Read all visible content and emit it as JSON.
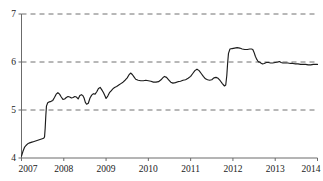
{
  "chart_data": {
    "type": "line",
    "title": "",
    "subtitle": "",
    "xlabel": "",
    "ylabel": "",
    "xlim": [
      2007.0,
      2014.0
    ],
    "ylim": [
      4,
      7
    ],
    "grid": true,
    "grid_axis": "y",
    "legend": false,
    "legend_position": "none",
    "line_color": "#1c1c1c",
    "grid_color": "#4d4d4d",
    "axis_color": "#6b6b6b",
    "background_color": "#ffffff",
    "y_ticks": [
      4,
      5,
      6,
      7
    ],
    "y_tick_labels": [
      "4",
      "5",
      "6",
      "7"
    ],
    "x_ticks": [
      2007,
      2008,
      2009,
      2010,
      2011,
      2012,
      2013,
      2014
    ],
    "x_tick_labels": [
      "2007",
      "2008",
      "2009",
      "2010",
      "2011",
      "2012",
      "2013",
      "2014"
    ],
    "series": [
      {
        "name": "series-1",
        "x": [
          2007.0,
          2007.035,
          2007.07,
          2007.105,
          2007.14,
          2007.175,
          2007.21,
          2007.245,
          2007.28,
          2007.315,
          2007.35,
          2007.385,
          2007.42,
          2007.455,
          2007.49,
          2007.525,
          2007.545,
          2007.56,
          2007.575,
          2007.59,
          2007.62,
          2007.66,
          2007.7,
          2007.74,
          2007.78,
          2007.82,
          2007.86,
          2007.9,
          2007.94,
          2007.98,
          2008.02,
          2008.06,
          2008.1,
          2008.14,
          2008.18,
          2008.22,
          2008.26,
          2008.3,
          2008.34,
          2008.38,
          2008.42,
          2008.45,
          2008.48,
          2008.51,
          2008.54,
          2008.58,
          2008.62,
          2008.66,
          2008.7,
          2008.74,
          2008.78,
          2008.82,
          2008.86,
          2008.9,
          2008.94,
          2008.97,
          2009.0,
          2009.04,
          2009.08,
          2009.12,
          2009.16,
          2009.2,
          2009.25,
          2009.3,
          2009.35,
          2009.4,
          2009.45,
          2009.5,
          2009.54,
          2009.58,
          2009.62,
          2009.66,
          2009.7,
          2009.76,
          2009.82,
          2009.88,
          2009.94,
          2010.0,
          2010.06,
          2010.12,
          2010.18,
          2010.24,
          2010.3,
          2010.34,
          2010.38,
          2010.43,
          2010.48,
          2010.53,
          2010.58,
          2010.64,
          2010.7,
          2010.76,
          2010.82,
          2010.88,
          2010.94,
          2011.0,
          2011.05,
          2011.1,
          2011.15,
          2011.2,
          2011.25,
          2011.3,
          2011.35,
          2011.4,
          2011.45,
          2011.5,
          2011.55,
          2011.6,
          2011.65,
          2011.7,
          2011.75,
          2011.8,
          2011.83,
          2011.855,
          2011.875,
          2011.895,
          2011.93,
          2011.98,
          2012.04,
          2012.1,
          2012.16,
          2012.22,
          2012.28,
          2012.34,
          2012.4,
          2012.44,
          2012.47,
          2012.5,
          2012.53,
          2012.56,
          2012.59,
          2012.61,
          2012.63,
          2012.66,
          2012.7,
          2012.74,
          2012.79,
          2012.84,
          2012.89,
          2012.94,
          2013.0,
          2013.06,
          2013.1,
          2013.14,
          2013.18,
          2013.24,
          2013.3,
          2013.36,
          2013.42,
          2013.48,
          2013.54,
          2013.6,
          2013.66,
          2013.72,
          2013.78,
          2013.84,
          2013.9,
          2013.95,
          2014.0
        ],
        "y": [
          4.04,
          4.14,
          4.22,
          4.26,
          4.29,
          4.31,
          4.32,
          4.33,
          4.34,
          4.35,
          4.36,
          4.37,
          4.38,
          4.39,
          4.4,
          4.41,
          4.44,
          4.62,
          4.88,
          5.08,
          5.15,
          5.17,
          5.18,
          5.2,
          5.26,
          5.33,
          5.36,
          5.33,
          5.27,
          5.22,
          5.23,
          5.26,
          5.28,
          5.27,
          5.25,
          5.26,
          5.28,
          5.27,
          5.23,
          5.3,
          5.32,
          5.3,
          5.25,
          5.16,
          5.12,
          5.14,
          5.25,
          5.31,
          5.34,
          5.33,
          5.38,
          5.45,
          5.47,
          5.42,
          5.36,
          5.3,
          5.24,
          5.29,
          5.36,
          5.4,
          5.44,
          5.47,
          5.49,
          5.52,
          5.55,
          5.58,
          5.62,
          5.67,
          5.73,
          5.77,
          5.74,
          5.69,
          5.64,
          5.62,
          5.61,
          5.61,
          5.62,
          5.61,
          5.6,
          5.58,
          5.58,
          5.59,
          5.63,
          5.67,
          5.7,
          5.68,
          5.63,
          5.58,
          5.56,
          5.57,
          5.59,
          5.6,
          5.62,
          5.63,
          5.66,
          5.7,
          5.76,
          5.82,
          5.85,
          5.82,
          5.76,
          5.7,
          5.65,
          5.63,
          5.62,
          5.63,
          5.67,
          5.68,
          5.66,
          5.61,
          5.55,
          5.5,
          5.52,
          5.72,
          5.98,
          6.18,
          6.27,
          6.28,
          6.29,
          6.3,
          6.29,
          6.27,
          6.26,
          6.26,
          6.27,
          6.27,
          6.26,
          6.2,
          6.12,
          6.06,
          6.02,
          6.0,
          6.0,
          5.98,
          5.96,
          5.97,
          5.99,
          5.99,
          5.98,
          5.98,
          5.99,
          6.0,
          6.01,
          5.99,
          5.98,
          5.98,
          5.98,
          5.97,
          5.97,
          5.96,
          5.96,
          5.95,
          5.95,
          5.95,
          5.94,
          5.94,
          5.95,
          5.95,
          5.95
        ]
      }
    ]
  }
}
